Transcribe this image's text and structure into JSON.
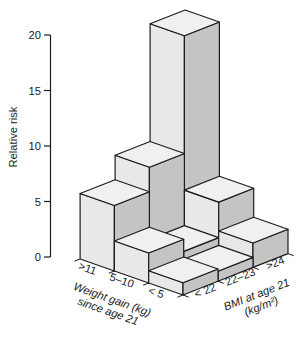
{
  "chart_data": {
    "type": "bar3d",
    "z_axis": {
      "label": "Relative risk",
      "ticks": [
        0,
        5,
        10,
        15,
        20
      ],
      "min": 0,
      "max": 20
    },
    "row_axis": {
      "title_lines": [
        "Weight gain (kg)",
        "since age 21"
      ],
      "categories": [
        ">11",
        "5–10",
        "< 5"
      ]
    },
    "col_axis": {
      "title_lines": [
        "BMI at age 21",
        "(kg/m²)"
      ],
      "categories": [
        "< 22",
        "22–23",
        ">24"
      ]
    },
    "series": [
      {
        "name": ">11",
        "values": [
          5.9,
          8.1,
          18.7
        ]
      },
      {
        "name": "5–10",
        "values": [
          2.7,
          1.6,
          4.8
        ]
      },
      {
        "name": "< 5",
        "values": [
          1.1,
          0.9,
          2.2
        ]
      }
    ],
    "legend": "none",
    "grid": "off",
    "colors": {
      "face_top": "#f0f0ee",
      "face_left": "#e8e8e6",
      "face_right": "#c4c4c2",
      "outline": "#1c1c1c"
    }
  }
}
